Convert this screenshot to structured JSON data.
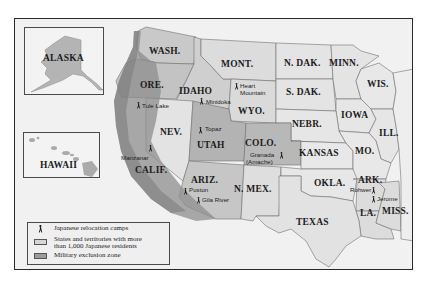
{
  "map": {
    "colors": {
      "background": "#ffffff",
      "frame_fill": "#f1f1f1",
      "ocean": "#f1f1f1",
      "states_with_residents": "#d2d2d2",
      "other_states": "#e4e4e4",
      "exclusion_zone": "#9a9a9a",
      "border": "#6b6b6b"
    },
    "insets": {
      "alaska": {
        "label": "ALASKA"
      },
      "hawaii": {
        "label": "HAWAII"
      }
    },
    "states": {
      "wash": "WASH.",
      "ore": "ORE.",
      "idaho": "IDAHO",
      "mont": "MONT.",
      "wyo": "WYO.",
      "ndak": "N. DAK.",
      "sdak": "S. DAK.",
      "minn": "MINN.",
      "wis": "WIS.",
      "iowa": "IOWA",
      "ill": "ILL.",
      "nebr": "NEBR.",
      "nev": "NEV.",
      "utah": "UTAH",
      "colo": "COLO.",
      "kansas": "KANSAS",
      "mo": "MO.",
      "calif": "CALIF.",
      "ariz": "ARIZ.",
      "nmex": "N. MEX.",
      "okla": "OKLA.",
      "ark": "ARK.",
      "texas": "TEXAS",
      "la": "LA.",
      "miss": "MISS."
    },
    "camps": {
      "tule_lake": "Tule Lake",
      "minidoka": "Minidoka",
      "heart_mountain_1": "Heart",
      "heart_mountain_2": "Mountain",
      "topaz": "Topaz",
      "manzanar": "Manzanar",
      "granada_1": "Granada",
      "granada_2": "(Amache)",
      "poston": "Poston",
      "gila_river": "Gila River",
      "rohwer": "Rohwer",
      "jerome": "Jerome"
    },
    "camp_icon": "🚶"
  },
  "legend": {
    "items": [
      {
        "icon": "person-walking-icon",
        "label": "Japanese relocation camps"
      },
      {
        "swatch": "#d6d6d6",
        "label_line1": "States and territories with more",
        "label_line2": "than 1,000 Japanese residents"
      },
      {
        "swatch": "#9a9a9a",
        "label": "Military exclusion zone"
      }
    ]
  }
}
